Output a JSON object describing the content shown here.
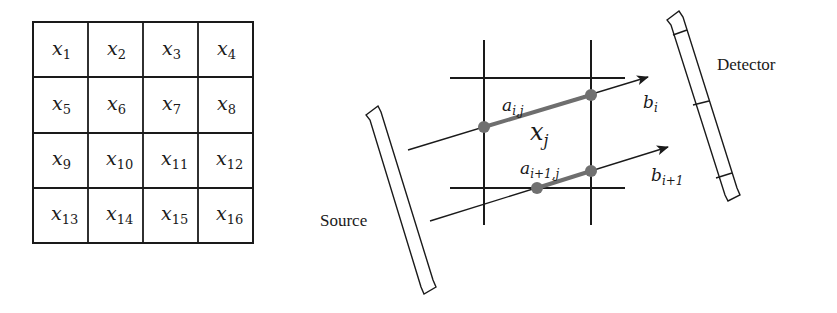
{
  "pixel_grid": {
    "rows": 4,
    "cols": 4,
    "cells": [
      {
        "var": "x",
        "sub": "1"
      },
      {
        "var": "x",
        "sub": "2"
      },
      {
        "var": "x",
        "sub": "3"
      },
      {
        "var": "x",
        "sub": "4"
      },
      {
        "var": "x",
        "sub": "5"
      },
      {
        "var": "x",
        "sub": "6"
      },
      {
        "var": "x",
        "sub": "7"
      },
      {
        "var": "x",
        "sub": "8"
      },
      {
        "var": "x",
        "sub": "9"
      },
      {
        "var": "x",
        "sub": "10"
      },
      {
        "var": "x",
        "sub": "11"
      },
      {
        "var": "x",
        "sub": "12"
      },
      {
        "var": "x",
        "sub": "13"
      },
      {
        "var": "x",
        "sub": "14"
      },
      {
        "var": "x",
        "sub": "15"
      },
      {
        "var": "x",
        "sub": "16"
      }
    ]
  },
  "projection": {
    "source_label": "Source",
    "detector_label": "Detector",
    "pixel_label": {
      "var": "x",
      "sub": "j"
    },
    "ray_upper": {
      "weight_label": {
        "var": "a",
        "sub": "i,j"
      },
      "measurement_label": {
        "var": "b",
        "sub": "i"
      }
    },
    "ray_lower": {
      "weight_label": {
        "var": "a",
        "sub": "i+1,j"
      },
      "measurement_label": {
        "var": "b",
        "sub": "i+1"
      }
    }
  },
  "colors": {
    "line": "#1a1a1a",
    "segment": "#6e6e6e",
    "node": "#707070",
    "background": "#ffffff"
  }
}
